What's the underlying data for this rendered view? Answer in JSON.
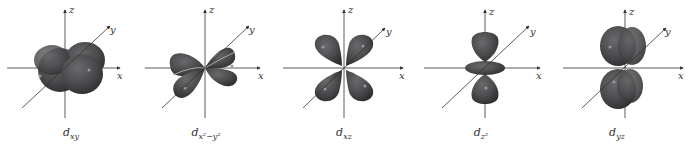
{
  "figure": {
    "axis_labels": {
      "x": "x",
      "y": "y",
      "z": "z"
    },
    "lobe_color": "#4a4a4c",
    "highlight_color": "#8e8e90",
    "axis_color": "#333333",
    "orbitals": [
      {
        "name": "dxy",
        "label_main": "d",
        "label_sub": "xy"
      },
      {
        "name": "dx2-y2",
        "label_main": "d",
        "label_sub": "x²−y²"
      },
      {
        "name": "dxz",
        "label_main": "d",
        "label_sub": "xz"
      },
      {
        "name": "dz2",
        "label_main": "d",
        "label_sub": "z²"
      },
      {
        "name": "dyz",
        "label_main": "d",
        "label_sub": "yz"
      }
    ]
  }
}
